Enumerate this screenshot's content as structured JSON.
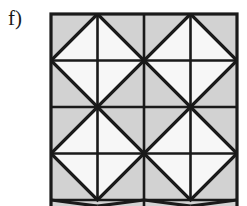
{
  "figure": {
    "panel_label": "f)",
    "caption_text": "f)",
    "background_color": "#ffffff",
    "shade_color": "#d2d2d2",
    "line_color": "#1a1a1a",
    "white_color": "#f7f7f7",
    "outline_width": 3,
    "inner_line_width": 3,
    "median_line_width": 2.4,
    "geometry": {
      "origin_x": 51,
      "origin_y": 14,
      "cell_size": 93,
      "cols": 2,
      "rows": 2,
      "total_width": 186,
      "total_height": 186,
      "clip_bottom_y": 206,
      "cut_off_at_bottom": true
    },
    "cell_motif": {
      "name": "diamond-in-square",
      "shaded_regions": [
        "corner-triangle-top-left",
        "corner-triangle-top-right",
        "corner-triangle-bottom-right",
        "corner-triangle-bottom-left"
      ],
      "white_regions": [
        "diamond-triangle-north",
        "diamond-triangle-east",
        "diamond-triangle-south",
        "diamond-triangle-west"
      ],
      "lines": [
        "diamond-edge-nw",
        "diamond-edge-ne",
        "diamond-edge-se",
        "diamond-edge-sw",
        "median-horizontal",
        "median-vertical"
      ]
    }
  }
}
